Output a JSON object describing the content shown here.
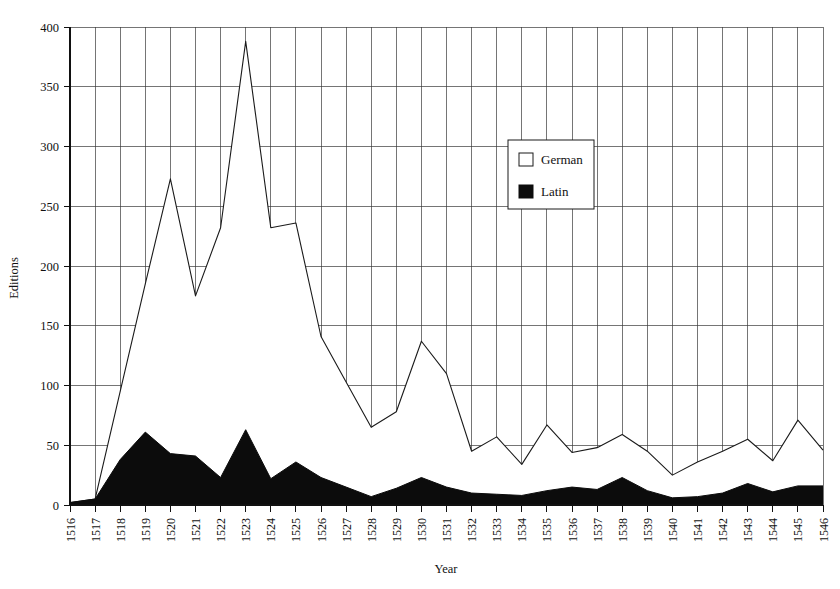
{
  "chart_data": {
    "type": "area",
    "title": "",
    "xlabel": "Year",
    "ylabel": "Editions",
    "ylim": [
      0,
      400
    ],
    "ytick_step": 50,
    "yticks": [
      0,
      50,
      100,
      150,
      200,
      250,
      300,
      350,
      400
    ],
    "grid": true,
    "legend_position": "inside-upper-right",
    "stacked": false,
    "categories": [
      "1516",
      "1517",
      "1518",
      "1519",
      "1520",
      "1521",
      "1522",
      "1523",
      "1524",
      "1525",
      "1526",
      "1527",
      "1528",
      "1529",
      "1530",
      "1531",
      "1532",
      "1533",
      "1534",
      "1535",
      "1536",
      "1537",
      "1538",
      "1539",
      "1540",
      "1541",
      "1542",
      "1543",
      "1544",
      "1545",
      "1546"
    ],
    "series": [
      {
        "name": "German",
        "color": "#ffffff",
        "values": [
          2,
          5,
          95,
          185,
          273,
          175,
          232,
          388,
          232,
          236,
          141,
          103,
          65,
          78,
          137,
          110,
          45,
          57,
          34,
          67,
          44,
          48,
          59,
          45,
          25,
          36,
          45,
          55,
          37,
          71,
          46
        ]
      },
      {
        "name": "Latin",
        "color": "#0c0c0c",
        "values": [
          2,
          5,
          38,
          61,
          43,
          41,
          23,
          63,
          22,
          36,
          23,
          15,
          7,
          14,
          23,
          15,
          10,
          9,
          8,
          12,
          15,
          13,
          23,
          12,
          6,
          7,
          10,
          18,
          11,
          16,
          16
        ]
      }
    ],
    "legend": [
      {
        "label": "German",
        "swatch": "white-square"
      },
      {
        "label": "Latin",
        "swatch": "black-square"
      }
    ]
  },
  "axes": {
    "y_title": "Editions",
    "x_title": "Year",
    "y_tick_labels": [
      "400",
      "350",
      "300",
      "250",
      "200",
      "150",
      "100",
      "50",
      "0"
    ],
    "x_tick_labels": [
      "1516",
      "1517",
      "1518",
      "1519",
      "1520",
      "1521",
      "1522",
      "1523",
      "1524",
      "1525",
      "1526",
      "1527",
      "1528",
      "1529",
      "1530",
      "1531",
      "1532",
      "1533",
      "1534",
      "1535",
      "1536",
      "1537",
      "1538",
      "1539",
      "1540",
      "1541",
      "1542",
      "1543",
      "1544",
      "1545",
      "1546"
    ]
  },
  "legend": {
    "german_label": "German",
    "latin_label": "Latin"
  },
  "colors": {
    "german_fill": "#ffffff",
    "latin_fill": "#0c0c0c",
    "line": "#1a1a1a",
    "grid": "#3a3a3a",
    "axis": "#111111",
    "background": "#ffffff"
  }
}
